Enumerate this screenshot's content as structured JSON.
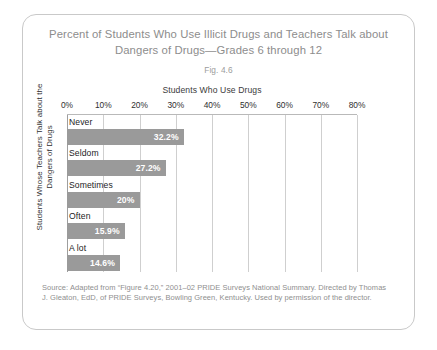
{
  "figure": {
    "title": "Percent of Students Who Use Illicit Drugs and Teachers Talk about Dangers of Drugs—Grades 6 through 12",
    "number": "Fig. 4.6",
    "source": "Source: Adapted from “Figure 4.20,” 2001–02 PRIDE Surveys National Summary. Directed by Thomas J. Gleaton, EdD, of PRIDE Surveys, Bowling Green, Kentucky. Used by permission of the director."
  },
  "chart_data": {
    "type": "bar",
    "orientation": "horizontal",
    "title": "Percent of Students Who Use Illicit Drugs and Teachers Talk about Dangers of Drugs—Grades 6 through 12",
    "xlabel": "Students Who Use Drugs",
    "ylabel": "Students Whose Teachers Talk about the Dangers of Drugs",
    "categories": [
      "Never",
      "Seldom",
      "Sometimes",
      "Often",
      "A lot"
    ],
    "values": [
      32.2,
      27.2,
      20,
      15.9,
      14.6
    ],
    "value_labels": [
      "32.2%",
      "27.2%",
      "20%",
      "15.9%",
      "14.6%"
    ],
    "xlim": [
      0,
      80
    ],
    "xticks": [
      0,
      10,
      20,
      30,
      40,
      50,
      60,
      70,
      80
    ],
    "xtick_labels": [
      "0%",
      "10%",
      "20%",
      "30%",
      "40%",
      "50%",
      "60%",
      "70%",
      "80%"
    ],
    "grid": true,
    "legend": false,
    "bar_color": "#9a9a9a",
    "value_label_color": "#ffffff"
  }
}
